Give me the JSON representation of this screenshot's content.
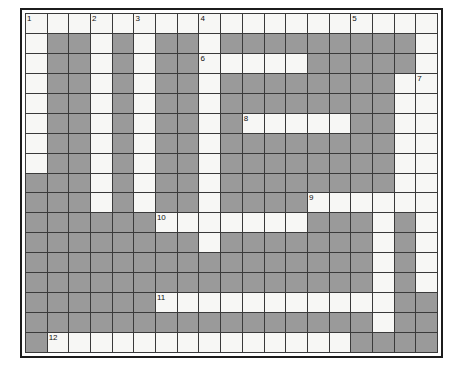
{
  "puzzle": {
    "kind": "crossword-grid",
    "columns": 19,
    "rows": 17,
    "colors": {
      "open_cell": "#f7f7f5",
      "blocked_cell": "#9a9a9a",
      "grid_line": "#3a3a3a",
      "frame": "#1c1c1c",
      "number_text": "#111111",
      "page_background": "#ffffff"
    },
    "legend": {
      "open": "o",
      "blocked": "#"
    },
    "cells": [
      "ooooooooooooooooooo",
      "o##o#o##o#########o",
      "o##o#o##ooooo#####o",
      "o##o#o##o########oo",
      "o##o#o##o########oo",
      "o##o#o##o#ooooo##oo",
      "o##o#o##o########oo",
      "o##o#o##o########oo",
      "###o#o##o########oo",
      "###o#o##o####oooooo",
      "######ooooooo###o#o",
      "########o#######o#o",
      "################o#o",
      "################o#o",
      "######ooooooooooo##",
      "################o##",
      "#oooooooooooooo####"
    ],
    "numbers": [
      {
        "label": "1",
        "row": 1,
        "col": 1
      },
      {
        "label": "2",
        "row": 1,
        "col": 4
      },
      {
        "label": "3",
        "row": 1,
        "col": 6
      },
      {
        "label": "4",
        "row": 1,
        "col": 9
      },
      {
        "label": "5",
        "row": 1,
        "col": 16
      },
      {
        "label": "6",
        "row": 3,
        "col": 9
      },
      {
        "label": "7",
        "row": 4,
        "col": 19
      },
      {
        "label": "8",
        "row": 6,
        "col": 11
      },
      {
        "label": "9",
        "row": 10,
        "col": 14
      },
      {
        "label": "10",
        "row": 11,
        "col": 7
      },
      {
        "label": "11",
        "row": 15,
        "col": 7
      },
      {
        "label": "12",
        "row": 17,
        "col": 2
      }
    ]
  }
}
